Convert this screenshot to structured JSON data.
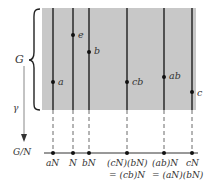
{
  "diagram": {
    "group_label": "G",
    "quotient_label": "G/N",
    "map_label": "γ",
    "colors": {
      "background": "#ffffff",
      "group_region": "#c8c8c8",
      "lines": "#2a2a2a",
      "text": "#333333"
    },
    "cosets": [
      {
        "x": 53,
        "axis_label": "aN",
        "axis_label2": ""
      },
      {
        "x": 73,
        "axis_label": "N",
        "axis_label2": ""
      },
      {
        "x": 89,
        "axis_label": "bN",
        "axis_label2": ""
      },
      {
        "x": 127,
        "axis_label": "(cN)(bN)",
        "axis_label2": "= (cb)N"
      },
      {
        "x": 164,
        "axis_label": "(ab)N",
        "axis_label2": "= (aN)(bN)"
      },
      {
        "x": 192,
        "axis_label": "cN",
        "axis_label2": ""
      }
    ],
    "points": [
      {
        "label": "a",
        "x": 53,
        "y": 82
      },
      {
        "label": "e",
        "x": 73,
        "y": 35
      },
      {
        "label": "b",
        "x": 89,
        "y": 52
      },
      {
        "label": "cb",
        "x": 127,
        "y": 82
      },
      {
        "label": "ab",
        "x": 164,
        "y": 77
      },
      {
        "label": "c",
        "x": 192,
        "y": 92
      }
    ]
  }
}
